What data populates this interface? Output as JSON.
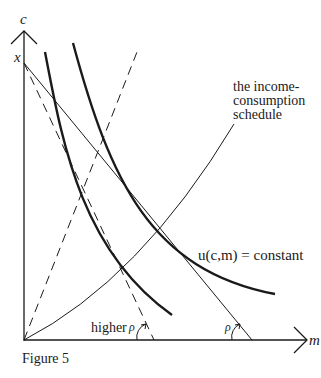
{
  "figure": {
    "caption": "Figure 5",
    "axes": {
      "y_label": "c",
      "x_label": "m",
      "intercept_label": "x"
    },
    "annotations": {
      "icc_line1": "the income-",
      "icc_line2": "consumption",
      "icc_line3": "schedule",
      "indifference": "u(c,m) = constant",
      "higher": "higher",
      "rho_higher": "ρ",
      "rho": "ρ"
    },
    "elements": [
      {
        "name": "budget-line",
        "style": "solid thin",
        "from": [
          0,
          "x"
        ],
        "to": "m-intercept"
      },
      {
        "name": "steeper-budget-line",
        "style": "dashed",
        "label": "higher ρ"
      },
      {
        "name": "dashed-ray",
        "style": "dashed"
      },
      {
        "name": "income-consumption-schedule",
        "style": "solid thin"
      },
      {
        "name": "indifference-curve-1",
        "style": "thick"
      },
      {
        "name": "indifference-curve-2",
        "style": "thick"
      }
    ],
    "colors": {
      "ink": "#1a1a1a",
      "background": "#ffffff"
    }
  }
}
